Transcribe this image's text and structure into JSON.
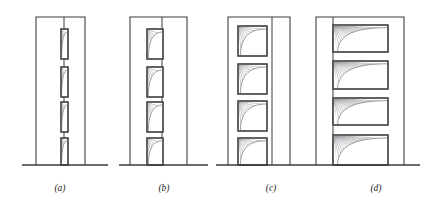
{
  "figure": {
    "name": "frame-openings-comparison",
    "background_color": "#ffffff",
    "line_color": "#3a3a3a",
    "opening_border_color": "#4a4a4a",
    "hatch_color": "#9a9aa0",
    "curve_color": "#8a8a90",
    "label_color": "#1a1a1a"
  },
  "panels": [
    {
      "id": "a",
      "label": "(a)",
      "label_x": 60,
      "label_y": 191,
      "ground": {
        "x1": 22,
        "x2": 108,
        "y": 165
      },
      "frame": {
        "x": 36,
        "y": 17,
        "width": 49,
        "height": 148
      },
      "inner_column_x": 64,
      "opening_width": 7,
      "opening_align": "center",
      "openings": [
        {
          "x": 61,
          "y": 29,
          "width": 7,
          "height": 30
        },
        {
          "x": 61,
          "y": 67,
          "width": 7,
          "height": 30
        },
        {
          "x": 61,
          "y": 102,
          "width": 7,
          "height": 30
        },
        {
          "x": 61,
          "y": 138,
          "width": 7,
          "height": 27
        }
      ]
    },
    {
      "id": "b",
      "label": "(b)",
      "label_x": 164,
      "label_y": 191,
      "ground": {
        "x1": 119,
        "x2": 208,
        "y": 165
      },
      "frame": {
        "x": 130,
        "y": 17,
        "width": 57,
        "height": 148
      },
      "inner_column_x": 162,
      "opening_width": 16,
      "opening_align": "center",
      "openings": [
        {
          "x": 147,
          "y": 29,
          "width": 16,
          "height": 30
        },
        {
          "x": 147,
          "y": 67,
          "width": 16,
          "height": 30
        },
        {
          "x": 147,
          "y": 102,
          "width": 16,
          "height": 30
        },
        {
          "x": 147,
          "y": 138,
          "width": 16,
          "height": 27
        }
      ]
    },
    {
      "id": "c",
      "label": "(c)",
      "label_x": 271,
      "label_y": 191,
      "ground": {
        "x1": 216,
        "x2": 305,
        "y": 165
      },
      "frame": {
        "x": 228,
        "y": 17,
        "width": 62,
        "height": 148
      },
      "inner_column_x": 272,
      "opening_width": 29,
      "opening_align": "left",
      "openings": [
        {
          "x": 238,
          "y": 26,
          "width": 29,
          "height": 30
        },
        {
          "x": 238,
          "y": 64,
          "width": 29,
          "height": 30
        },
        {
          "x": 238,
          "y": 101,
          "width": 29,
          "height": 30
        },
        {
          "x": 238,
          "y": 138,
          "width": 29,
          "height": 27
        }
      ]
    },
    {
      "id": "d",
      "label": "(d)",
      "label_x": 376,
      "label_y": 191,
      "ground": {
        "x1": 305,
        "x2": 420,
        "y": 165
      },
      "frame": {
        "x": 316,
        "y": 17,
        "width": 88,
        "height": 148
      },
      "inner_column_x": 333,
      "opening_width": 55,
      "opening_align": "left",
      "openings": [
        {
          "x": 333,
          "y": 25,
          "width": 55,
          "height": 27
        },
        {
          "x": 333,
          "y": 61,
          "width": 55,
          "height": 28
        },
        {
          "x": 333,
          "y": 98,
          "width": 55,
          "height": 27
        },
        {
          "x": 333,
          "y": 135,
          "width": 55,
          "height": 30
        }
      ]
    }
  ]
}
